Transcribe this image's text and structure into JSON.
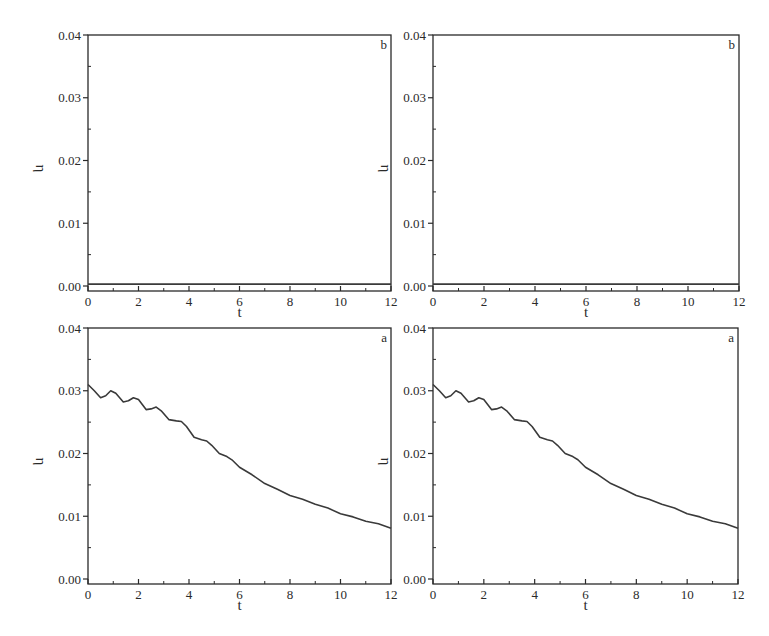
{
  "figure": {
    "panels": [
      {
        "id": "top-left",
        "tag": "b",
        "xlabel": "t",
        "ylabel": "η"
      },
      {
        "id": "top-right",
        "tag": "b",
        "xlabel": "t",
        "ylabel": "η"
      },
      {
        "id": "bottom-left",
        "tag": "a",
        "xlabel": "t",
        "ylabel": "η"
      },
      {
        "id": "bottom-right",
        "tag": "a",
        "xlabel": "t",
        "ylabel": "η"
      }
    ],
    "x_ticks": [
      "0",
      "2",
      "4",
      "6",
      "8",
      "10",
      "12"
    ],
    "y_ticks": [
      "0.00",
      "0.01",
      "0.02",
      "0.03",
      "0.04"
    ],
    "line_color": "#3a3a3a",
    "frame_color": "#2a2a2a"
  },
  "chart_data": [
    {
      "type": "line",
      "panel": "top-left",
      "tag": "b",
      "title": "",
      "xlabel": "t",
      "ylabel": "η",
      "xlim": [
        0,
        12
      ],
      "ylim": [
        0,
        0.04
      ],
      "x_ticks": [
        0,
        2,
        4,
        6,
        8,
        10,
        12
      ],
      "y_ticks": [
        0.0,
        0.01,
        0.02,
        0.03,
        0.04
      ],
      "grid": false,
      "series": [
        {
          "name": "η(t)",
          "x": [
            0,
            12
          ],
          "values": [
            0.0003,
            0.0003
          ]
        }
      ]
    },
    {
      "type": "line",
      "panel": "top-right",
      "tag": "b",
      "title": "",
      "xlabel": "t",
      "ylabel": "η",
      "xlim": [
        0,
        12
      ],
      "ylim": [
        0,
        0.04
      ],
      "x_ticks": [
        0,
        2,
        4,
        6,
        8,
        10,
        12
      ],
      "y_ticks": [
        0.0,
        0.01,
        0.02,
        0.03,
        0.04
      ],
      "grid": false,
      "series": [
        {
          "name": "η(t)",
          "x": [
            0,
            12
          ],
          "values": [
            0.0003,
            0.0003
          ]
        }
      ]
    },
    {
      "type": "line",
      "panel": "bottom-left",
      "tag": "a",
      "title": "",
      "xlabel": "t",
      "ylabel": "η",
      "xlim": [
        0,
        12
      ],
      "ylim": [
        0,
        0.04
      ],
      "x_ticks": [
        0,
        2,
        4,
        6,
        8,
        10,
        12
      ],
      "y_ticks": [
        0.0,
        0.01,
        0.02,
        0.03,
        0.04
      ],
      "grid": false,
      "series": [
        {
          "name": "η(t)",
          "x": [
            0,
            0.25,
            0.5,
            0.7,
            0.9,
            1.1,
            1.4,
            1.6,
            1.8,
            2.0,
            2.3,
            2.5,
            2.7,
            2.9,
            3.2,
            3.5,
            3.7,
            3.9,
            4.2,
            4.5,
            4.7,
            4.9,
            5.2,
            5.5,
            5.7,
            6.0,
            6.5,
            7.0,
            7.5,
            8.0,
            8.5,
            9.0,
            9.5,
            10.0,
            10.5,
            11.0,
            11.5,
            12.0
          ],
          "values": [
            0.031,
            0.03,
            0.0289,
            0.0292,
            0.03,
            0.0296,
            0.0282,
            0.0284,
            0.0289,
            0.0286,
            0.027,
            0.0271,
            0.0274,
            0.0268,
            0.0254,
            0.0252,
            0.0251,
            0.0243,
            0.0226,
            0.0222,
            0.022,
            0.0213,
            0.02,
            0.0195,
            0.019,
            0.0178,
            0.0166,
            0.0152,
            0.0143,
            0.0133,
            0.0127,
            0.0119,
            0.0113,
            0.0104,
            0.0099,
            0.0092,
            0.0088,
            0.0081
          ]
        }
      ]
    },
    {
      "type": "line",
      "panel": "bottom-right",
      "tag": "a",
      "title": "",
      "xlabel": "t",
      "ylabel": "η",
      "xlim": [
        0,
        12
      ],
      "ylim": [
        0,
        0.04
      ],
      "x_ticks": [
        0,
        2,
        4,
        6,
        8,
        10,
        12
      ],
      "y_ticks": [
        0.0,
        0.01,
        0.02,
        0.03,
        0.04
      ],
      "grid": false,
      "series": [
        {
          "name": "η(t)",
          "x": [
            0,
            0.25,
            0.5,
            0.7,
            0.9,
            1.1,
            1.4,
            1.6,
            1.8,
            2.0,
            2.3,
            2.5,
            2.7,
            2.9,
            3.2,
            3.5,
            3.7,
            3.9,
            4.2,
            4.5,
            4.7,
            4.9,
            5.2,
            5.5,
            5.7,
            6.0,
            6.5,
            7.0,
            7.5,
            8.0,
            8.5,
            9.0,
            9.5,
            10.0,
            10.5,
            11.0,
            11.5,
            12.0
          ],
          "values": [
            0.031,
            0.03,
            0.0289,
            0.0292,
            0.03,
            0.0296,
            0.0282,
            0.0284,
            0.0289,
            0.0286,
            0.027,
            0.0271,
            0.0274,
            0.0268,
            0.0254,
            0.0252,
            0.0251,
            0.0243,
            0.0226,
            0.0222,
            0.022,
            0.0213,
            0.02,
            0.0195,
            0.019,
            0.0178,
            0.0166,
            0.0152,
            0.0143,
            0.0133,
            0.0127,
            0.0119,
            0.0113,
            0.0104,
            0.0099,
            0.0092,
            0.0088,
            0.0081
          ]
        }
      ]
    }
  ]
}
